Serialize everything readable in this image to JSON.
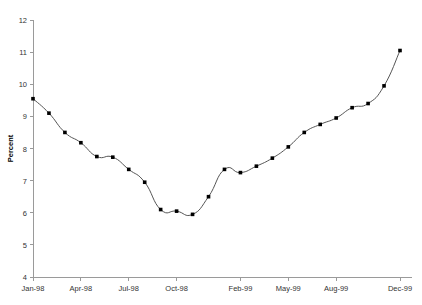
{
  "chart_data": {
    "type": "line",
    "title": "",
    "subtitle": "",
    "xlabel": "",
    "ylabel": "Percent",
    "ylim": [
      4,
      12
    ],
    "yticks": [
      4,
      5,
      6,
      7,
      8,
      9,
      10,
      11,
      12
    ],
    "ytick_labels": [
      "4",
      "5",
      "6",
      "7",
      "8",
      "9",
      "10",
      "11",
      "12"
    ],
    "xtick_labels": [
      "Jan-98",
      "Apr-98",
      "Jul-98",
      "Oct-98",
      "Feb-99",
      "May-99",
      "Aug-99",
      "Dec-99"
    ],
    "xtick_indices": [
      0,
      3,
      6,
      9,
      13,
      16,
      19,
      23
    ],
    "grid": false,
    "legend": null,
    "legend_position": "none",
    "marker": "square",
    "line_color": "#555555",
    "marker_color": "#000000",
    "axis_color": "#9a9a9a",
    "background_color": "#ffffff",
    "categories": [
      "Jan-98",
      "Feb-98",
      "Mar-98",
      "Apr-98",
      "May-98",
      "Jun-98",
      "Jul-98",
      "Aug-98",
      "Sep-98",
      "Oct-98",
      "Nov-98",
      "Dec-98",
      "Jan-99",
      "Feb-99",
      "Mar-99",
      "Apr-99",
      "May-99",
      "Jun-99",
      "Jul-99",
      "Aug-99",
      "Sep-99",
      "Oct-99",
      "Nov-99",
      "Dec-99"
    ],
    "values": [
      9.55,
      9.1,
      8.5,
      8.18,
      7.75,
      7.73,
      7.35,
      6.95,
      6.1,
      6.05,
      5.95,
      6.5,
      7.35,
      7.25,
      7.45,
      7.7,
      8.05,
      8.5,
      8.75,
      8.95,
      9.27,
      9.4,
      9.95,
      11.05
    ]
  }
}
